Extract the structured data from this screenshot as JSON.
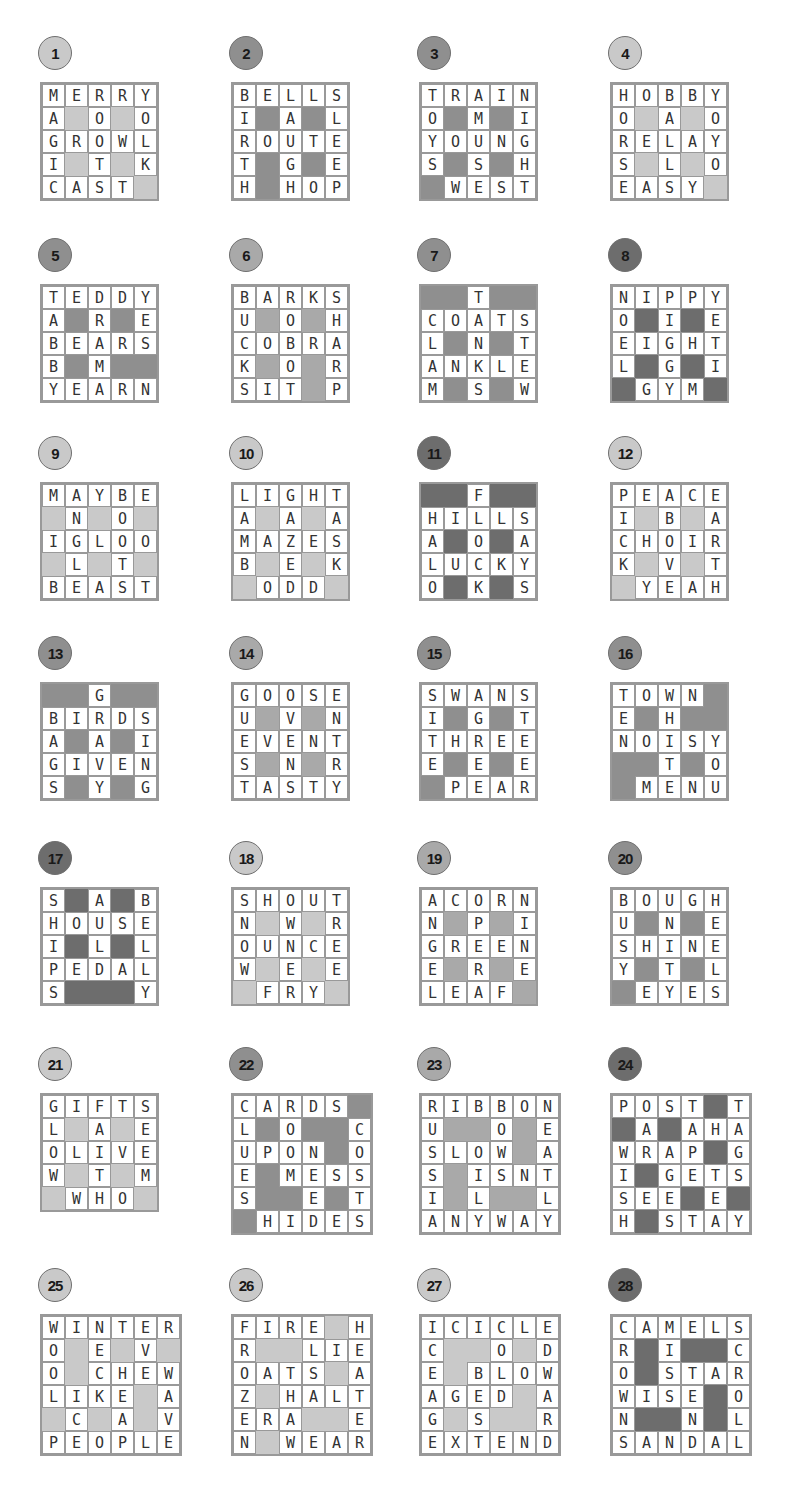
{
  "colors": {
    "light": "#c9c9c9",
    "medium": "#a9a9a9",
    "medium_dark": "#8f8f8f",
    "dark": "#6d6d6d"
  },
  "puzzles": [
    {
      "number": "1",
      "shade": "light",
      "x": 40,
      "y": 36,
      "rows": [
        "MERRY",
        "A#O#O",
        "GROWL",
        "I#T#K",
        "CAST#"
      ]
    },
    {
      "number": "2",
      "shade": "medium_dark",
      "x": 231,
      "y": 36,
      "rows": [
        "BELLS",
        "I#A#L",
        "ROUTE",
        "T#G#E",
        "H#HOP"
      ]
    },
    {
      "number": "3",
      "shade": "medium_dark",
      "x": 419,
      "y": 36,
      "rows": [
        "TRAIN",
        "O#M#I",
        "YOUNG",
        "S#S#H",
        "#WEST"
      ]
    },
    {
      "number": "4",
      "shade": "light",
      "x": 610,
      "y": 36,
      "rows": [
        "HOBBY",
        "O#A#O",
        "RELAY",
        "S#L#O",
        "EASY#"
      ]
    },
    {
      "number": "5",
      "shade": "medium_dark",
      "x": 40,
      "y": 238,
      "rows": [
        "TEDDY",
        "A#R#E",
        "BEARS",
        "B#M##",
        "YEARN"
      ]
    },
    {
      "number": "6",
      "shade": "medium",
      "x": 231,
      "y": 238,
      "rows": [
        "BARKS",
        "U#O#H",
        "COBRA",
        "K#O#R",
        "SIT#P"
      ]
    },
    {
      "number": "7",
      "shade": "medium_dark",
      "x": 419,
      "y": 238,
      "rows": [
        "##T##",
        "COATS",
        "L#N#T",
        "ANKLE",
        "M#S#W"
      ]
    },
    {
      "number": "8",
      "shade": "dark",
      "x": 610,
      "y": 238,
      "rows": [
        "NIPPY",
        "O#I#E",
        "EIGHT",
        "L#G#I",
        "#GYM#"
      ]
    },
    {
      "number": "9",
      "shade": "light",
      "x": 40,
      "y": 436,
      "rows": [
        "MAYBE",
        "#N#O#",
        "IGLOO",
        "#L#T#",
        "BEAST"
      ]
    },
    {
      "number": "10",
      "shade": "light",
      "x": 231,
      "y": 436,
      "rows": [
        "LIGHT",
        "A#A#A",
        "MAZES",
        "B#E#K",
        "#ODD#"
      ]
    },
    {
      "number": "11",
      "shade": "dark",
      "x": 419,
      "y": 436,
      "rows": [
        "##F##",
        "HILLS",
        "A#O#A",
        "LUCKY",
        "O#K#S"
      ]
    },
    {
      "number": "12",
      "shade": "light",
      "x": 610,
      "y": 436,
      "rows": [
        "PEACE",
        "I#B#A",
        "CHOIR",
        "K#V#T",
        "#YEAH"
      ]
    },
    {
      "number": "13",
      "shade": "medium_dark",
      "x": 40,
      "y": 636,
      "rows": [
        "##G##",
        "BIRDS",
        "A#A#I",
        "GIVEN",
        "S#Y#G"
      ]
    },
    {
      "number": "14",
      "shade": "medium",
      "x": 231,
      "y": 636,
      "rows": [
        "GOOSE",
        "U#V#N",
        "EVENT",
        "S#N#R",
        "TASTY"
      ]
    },
    {
      "number": "15",
      "shade": "medium_dark",
      "x": 419,
      "y": 636,
      "rows": [
        "SWANS",
        "I#G#T",
        "THREE",
        "E#E#E",
        "#PEAR"
      ]
    },
    {
      "number": "16",
      "shade": "medium_dark",
      "x": 610,
      "y": 636,
      "rows": [
        "TOWN#",
        "E#H##",
        "NOISY",
        "##T#O",
        "#MENU"
      ]
    },
    {
      "number": "17",
      "shade": "dark",
      "x": 40,
      "y": 841,
      "rows": [
        "S#A#B",
        "HOUSE",
        "I#L#L",
        "PEDAL",
        "S###Y"
      ]
    },
    {
      "number": "18",
      "shade": "light",
      "x": 231,
      "y": 841,
      "rows": [
        "SHOUT",
        "N#W#R",
        "OUNCE",
        "W#E#E",
        "#FRY#"
      ]
    },
    {
      "number": "19",
      "shade": "medium",
      "x": 419,
      "y": 841,
      "rows": [
        "ACORN",
        "N#P#I",
        "GREEN",
        "E#R#E",
        "LEAF#"
      ]
    },
    {
      "number": "20",
      "shade": "medium_dark",
      "x": 610,
      "y": 841,
      "rows": [
        "BOUGH",
        "U#N#E",
        "SHINE",
        "Y#T#L",
        "#EYES"
      ]
    },
    {
      "number": "21",
      "shade": "light",
      "x": 40,
      "y": 1047,
      "rows": [
        "GIFTS",
        "L#A#E",
        "OLIVE",
        "W#T#M",
        "#WHO#"
      ]
    },
    {
      "number": "22",
      "shade": "medium_dark",
      "x": 231,
      "y": 1047,
      "rows": [
        "CARDS#",
        "L#O##C",
        "UPON#O",
        "E#MESS",
        "S##E#T",
        "#HIDES"
      ]
    },
    {
      "number": "23",
      "shade": "medium",
      "x": 419,
      "y": 1047,
      "rows": [
        "RIBBON",
        "U##O#E",
        "SLOW#A",
        "S#ISNT",
        "I#L##L",
        "ANYWAY"
      ]
    },
    {
      "number": "24",
      "shade": "dark",
      "x": 610,
      "y": 1047,
      "rows": [
        "POST#T",
        "#A#AHA",
        "WRAP#G",
        "I#GETS",
        "SEE#E#",
        "H#STAY"
      ]
    },
    {
      "number": "25",
      "shade": "light",
      "x": 40,
      "y": 1268,
      "rows": [
        "WINTER",
        "O#E#V#",
        "O#CHEW",
        "LIKE#A",
        "#C#A#V",
        "PEOPLE"
      ]
    },
    {
      "number": "26",
      "shade": "light",
      "x": 231,
      "y": 1268,
      "rows": [
        "FIRE#H",
        "R##LIE",
        "OATS#A",
        "Z#HALT",
        "ERA##E",
        "N#WEAR"
      ]
    },
    {
      "number": "27",
      "shade": "light",
      "x": 419,
      "y": 1268,
      "rows": [
        "ICICLE",
        "C##O#D",
        "E#BLOW",
        "AGED#A",
        "G#S##R",
        "EXTEND"
      ]
    },
    {
      "number": "28",
      "shade": "dark",
      "x": 610,
      "y": 1268,
      "rows": [
        "CAMELS",
        "R#I##C",
        "O#STAR",
        "WISE#O",
        "N##N#L",
        "SANDAL"
      ]
    }
  ]
}
